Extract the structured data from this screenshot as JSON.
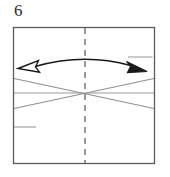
{
  "diagram": {
    "type": "origami-instruction-step",
    "step_number": "6",
    "colors": {
      "background": "#ffffff",
      "paper_border": "#5a5a5a",
      "crease_line": "#8c8c8c",
      "dashed_crease": "#6e6e6e",
      "arrow_stroke": "#1a1a1a",
      "arrow_fill_solid": "#1a1a1a",
      "arrow_fill_hollow": "#ffffff",
      "number_text": "#2b2b2b"
    },
    "paper": {
      "label": "paper-sheet",
      "x": 13,
      "y": 27,
      "width": 142,
      "height": 137
    },
    "creases": [
      {
        "name": "vertical-center-crease",
        "style": "dashed",
        "x1": 85,
        "y1": 28,
        "x2": 85,
        "y2": 163
      },
      {
        "name": "horizontal-center-crease",
        "style": "solid",
        "x1": 14,
        "y1": 93,
        "x2": 154,
        "y2": 93
      },
      {
        "name": "diagonal-crease-down-right",
        "style": "solid",
        "x1": 14,
        "y1": 78,
        "x2": 154,
        "y2": 108
      },
      {
        "name": "diagonal-crease-up-right",
        "style": "solid",
        "x1": 14,
        "y1": 108,
        "x2": 154,
        "y2": 78
      },
      {
        "name": "short-crease-lower-left",
        "style": "solid",
        "x1": 14,
        "y1": 127,
        "x2": 36,
        "y2": 127
      },
      {
        "name": "short-crease-upper-right",
        "style": "solid",
        "x1": 128,
        "y1": 57,
        "x2": 152,
        "y2": 57
      }
    ],
    "arrow": {
      "name": "fold-unfold-double-arrow",
      "kind": "double-headed-curved",
      "left_head": "hollow",
      "right_head": "solid",
      "arc_start_x": 34,
      "arc_start_y": 67,
      "arc_peak_y": 57,
      "arc_end_x": 131,
      "arc_end_y": 66
    }
  }
}
